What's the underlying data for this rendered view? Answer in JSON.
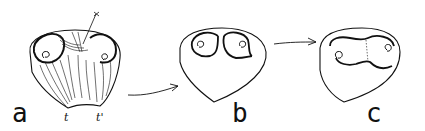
{
  "figure": {
    "panels": [
      {
        "id": "a",
        "label": "a",
        "annotations": {
          "top": "x",
          "left_notch": "t",
          "right_notch": "t'"
        }
      },
      {
        "id": "b",
        "label": "b"
      },
      {
        "id": "c",
        "label": "c"
      }
    ],
    "arrows": [
      "a-to-b",
      "b-to-c"
    ],
    "stroke_color": "#111111",
    "background": "#ffffff"
  }
}
